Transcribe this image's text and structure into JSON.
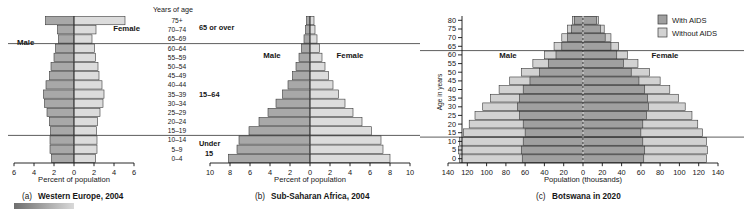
{
  "figure": {
    "title_hidden": "",
    "age_header": "Years of age",
    "age_labels": [
      "75+",
      "70–74",
      "65–69",
      "60–64",
      "55–59",
      "50–54",
      "45–49",
      "40–44",
      "35–39",
      "30–34",
      "25–29",
      "20–24",
      "15–19",
      "10–14",
      "5–9",
      "0–4"
    ],
    "group_labels": {
      "old": "65 or over",
      "mid": "15–64",
      "young_line1": "Under",
      "young_line2": "15"
    },
    "male_label": "Male",
    "female_label": "Female"
  },
  "legend": {
    "items": [
      {
        "label": "With AIDS",
        "color": "#a0a0a0"
      },
      {
        "label": "Without AIDS",
        "color": "#d2d2d2"
      }
    ]
  },
  "chart_data": [
    {
      "id": "a",
      "type": "bar",
      "title": "(a) Western Europe, 2004",
      "caption_prefix": "(a)",
      "caption_bold": "Western Europe, 2004",
      "xlabel": "Percent of population",
      "ylabel": "",
      "xticks": [
        6,
        4,
        2,
        0,
        2,
        4,
        6
      ],
      "xlim": [
        -6,
        6
      ],
      "grid": false,
      "categories": [
        "75+",
        "70–74",
        "65–69",
        "60–64",
        "55–59",
        "50–54",
        "45–49",
        "40–44",
        "35–39",
        "30–34",
        "25–29",
        "20–24",
        "15–19",
        "10–14",
        "5–9",
        "0–4"
      ],
      "series": [
        {
          "name": "Male",
          "side": "left",
          "values": [
            2.85,
            1.65,
            1.55,
            1.85,
            2.0,
            2.3,
            2.45,
            2.8,
            3.05,
            2.95,
            2.7,
            2.45,
            2.35,
            2.4,
            2.4,
            2.25
          ]
        },
        {
          "name": "Female",
          "side": "right",
          "values": [
            5.1,
            2.2,
            1.8,
            2.05,
            2.15,
            2.4,
            2.5,
            2.8,
            3.0,
            2.9,
            2.6,
            2.35,
            2.25,
            2.3,
            2.3,
            2.15
          ]
        }
      ]
    },
    {
      "id": "b",
      "type": "bar",
      "title": "(b) Sub-Saharan Africa, 2004",
      "caption_prefix": "(b)",
      "caption_bold": "Sub-Saharan Africa, 2004",
      "xlabel": "Percent of population",
      "ylabel": "",
      "xticks": [
        10,
        8,
        6,
        4,
        2,
        0,
        2,
        4,
        6,
        8,
        10
      ],
      "xlim": [
        -10,
        10
      ],
      "grid": false,
      "categories": [
        "75+",
        "70–74",
        "65–69",
        "60–64",
        "55–59",
        "50–54",
        "45–49",
        "40–44",
        "35–39",
        "30–34",
        "25–29",
        "20–24",
        "15–19",
        "10–14",
        "5–9",
        "0–4"
      ],
      "series": [
        {
          "name": "Male",
          "side": "left",
          "values": [
            0.35,
            0.45,
            0.6,
            0.85,
            1.1,
            1.4,
            1.75,
            2.2,
            2.75,
            3.4,
            4.2,
            5.1,
            6.1,
            7.1,
            7.3,
            8.15
          ]
        },
        {
          "name": "Female",
          "side": "right",
          "values": [
            0.4,
            0.5,
            0.7,
            0.95,
            1.2,
            1.5,
            1.85,
            2.3,
            2.85,
            3.5,
            4.3,
            5.2,
            6.15,
            7.1,
            7.3,
            8.0
          ]
        }
      ]
    },
    {
      "id": "c",
      "type": "bar",
      "title": "(c) Botswana in 2020",
      "caption_prefix": "(c)",
      "caption_bold": "Botswana in 2020",
      "xlabel": "Population (thousands)",
      "ylabel": "Age in years",
      "xticks": [
        140,
        120,
        100,
        80,
        60,
        40,
        20,
        0,
        20,
        40,
        60,
        80,
        100,
        120,
        140
      ],
      "yticks": [
        80,
        75,
        70,
        65,
        60,
        55,
        50,
        45,
        40,
        35,
        30,
        25,
        20,
        15,
        10,
        5,
        0
      ],
      "xlim": [
        -140,
        140
      ],
      "grid": false,
      "categories": [
        "80",
        "75",
        "70",
        "65",
        "60",
        "55",
        "50",
        "45",
        "40",
        "35",
        "30",
        "25",
        "20",
        "15",
        "10",
        "5",
        "0"
      ],
      "series": [
        {
          "name": "With AIDS",
          "side": "left",
          "values": [
            9,
            12,
            16,
            22,
            28,
            36,
            45,
            55,
            62,
            66,
            68,
            66,
            62,
            60,
            62,
            64,
            63
          ]
        },
        {
          "name": "With AIDS",
          "side": "right",
          "values": [
            14,
            18,
            23,
            29,
            35,
            42,
            50,
            58,
            64,
            67,
            68,
            66,
            62,
            60,
            62,
            64,
            63
          ]
        },
        {
          "name": "Without AIDS",
          "side": "left",
          "values": [
            11,
            16,
            22,
            30,
            40,
            52,
            64,
            76,
            87,
            96,
            104,
            112,
            118,
            124,
            128,
            129,
            128
          ]
        },
        {
          "name": "Without AIDS",
          "side": "right",
          "values": [
            16,
            22,
            29,
            37,
            46,
            57,
            69,
            80,
            90,
            99,
            106,
            113,
            119,
            124,
            128,
            129,
            128
          ]
        }
      ]
    }
  ]
}
